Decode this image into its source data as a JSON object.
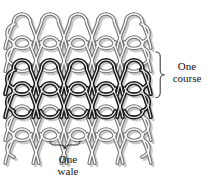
{
  "figure": {
    "kind": "knit-loop-structure-diagram",
    "background_color": "#ffffff"
  },
  "fabric": {
    "columns": 5,
    "rows": 6,
    "wale_pitch_px": 28,
    "course_pitch_px": 23,
    "yarn_outline_color": "#6e6e6e",
    "yarn_fill_color": "#f2f2f2",
    "yarn_shadow_color": "#b9b9b9",
    "highlight_color": "#1b1b1b",
    "highlight_core_color": "#ffffff",
    "highlighted_course_index": 2
  },
  "annotations": {
    "course": {
      "label_line1": "One",
      "label_line2": "course",
      "brace_orientation": "vertical-right"
    },
    "wale": {
      "label_line1": "One",
      "label_line2": "wale",
      "brace_orientation": "horizontal-bottom"
    }
  }
}
